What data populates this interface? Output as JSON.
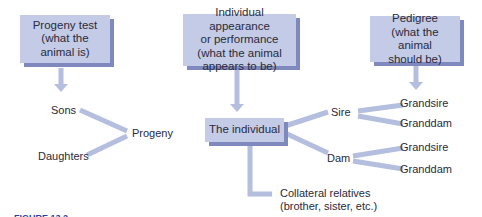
{
  "boxes": {
    "progeny_test": "Progeny test (what the animal is)",
    "individual_appearance": "Individual appearance or performance (what the animal appears to be)",
    "pedigree": "Pedigree (what the animal should be)",
    "the_individual": "The individual"
  },
  "box_lines": {
    "progeny_test": [
      "Progeny test",
      "(what the",
      "animal is)"
    ],
    "individual_appearance": [
      "Individual appearance",
      "or performance",
      "(what the animal",
      "appears to be)"
    ],
    "pedigree": [
      "Pedigree",
      "(what the animal",
      "should be)"
    ]
  },
  "labels": {
    "sons": "Sons",
    "daughters": "Daughters",
    "progeny": "Progeny",
    "sire": "Sire",
    "dam": "Dam",
    "sire_grandsire": "Grandsire",
    "sire_granddam": "Granddam",
    "dam_grandsire": "Grandsire",
    "dam_granddam": "Granddam",
    "collateral_line1": "Collateral relatives",
    "collateral_line2": "(brother, sister, etc.)"
  },
  "caption": "FIGURE 13.2",
  "colors": {
    "box_fill": "#c3cbe6",
    "box_shadow": "#7f89be",
    "connector": "#b4bedf",
    "caption": "#2b3f9c"
  }
}
